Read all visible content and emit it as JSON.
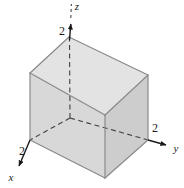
{
  "figure": {
    "type": "3d-coordinate-diagram",
    "background_color": "#ffffff",
    "axes": {
      "z": {
        "name": "z",
        "tick_label": "2",
        "direction": "up",
        "style": "dashed-inside-solid-outside",
        "arrow": true
      },
      "y": {
        "name": "y",
        "tick_label": "2",
        "direction": "right",
        "style": "dashed-inside-solid-outside",
        "arrow": true
      },
      "x": {
        "name": "x",
        "tick_label": "2",
        "direction": "lower-left",
        "style": "dashed-inside-solid-outside",
        "arrow": true
      }
    },
    "solid": {
      "shape": "cube",
      "side_length": 2,
      "face_colors": {
        "top": "#e2e2e2",
        "left": "#d9d9d9",
        "right": "#cfcfcf"
      },
      "edge_color": "#8c8c8c",
      "hidden_edge_color": "#3a3a3a"
    }
  }
}
